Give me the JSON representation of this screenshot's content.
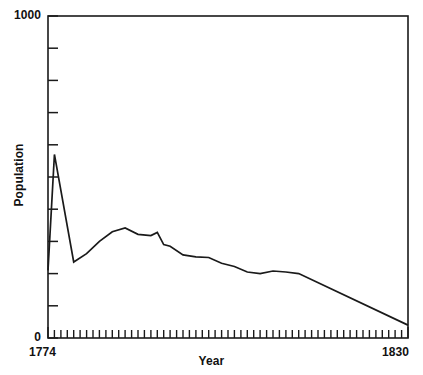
{
  "chart_data": {
    "type": "line",
    "title": "",
    "subtitle": "",
    "xlabel": "Year",
    "ylabel": "Population",
    "xlim": [
      1774,
      1830
    ],
    "ylim": [
      0,
      1000
    ],
    "x_tick_labels": [
      "1774",
      "1830"
    ],
    "y_tick_labels": [
      "1000",
      "0"
    ],
    "x_minor_tick_interval": 1,
    "y_minor_tick_interval": 100,
    "grid": false,
    "legend": null,
    "legend_position": "none",
    "line_color": "#1a1a1a",
    "background_color": "#ffffff",
    "frame": "full-box",
    "series": [
      {
        "name": "Population",
        "x": [
          1774,
          1775,
          1778,
          1780,
          1782,
          1784,
          1786,
          1788,
          1790,
          1791,
          1792,
          1793,
          1795,
          1797,
          1799,
          1801,
          1803,
          1805,
          1807,
          1809,
          1811,
          1813,
          1830
        ],
        "values": [
          210,
          570,
          236,
          262,
          300,
          330,
          342,
          322,
          318,
          328,
          290,
          285,
          258,
          252,
          250,
          232,
          222,
          205,
          200,
          208,
          205,
          200,
          40
        ]
      }
    ],
    "annotations": []
  },
  "axes": {
    "y_top_label": "1000",
    "y_bottom_label": "0",
    "x_left_label": "1774",
    "x_right_label": "1830",
    "y_title": "Population",
    "x_title": "Year"
  }
}
